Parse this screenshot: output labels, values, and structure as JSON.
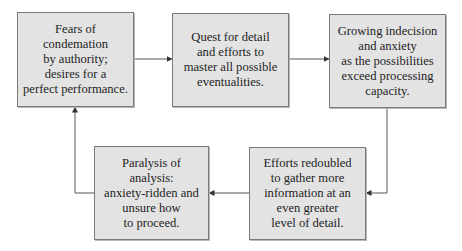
{
  "diagram": {
    "type": "cyclic-flowchart",
    "colors": {
      "box_fill": "#e3e3e3",
      "box_border": "#7a7a7a",
      "connector": "#555555",
      "text": "#1e1e1e"
    },
    "nodes": [
      {
        "id": "fears",
        "label": "Fears of\ncondemation\nby authority;\ndesires for a\nperfect performance."
      },
      {
        "id": "quest",
        "label": "Quest for detail\nand efforts to\nmaster all possible\neventualities."
      },
      {
        "id": "indecision",
        "label": "Growing indecision\nand anxiety\nas the possibilities\nexceed processing\ncapacity."
      },
      {
        "id": "efforts",
        "label": "Efforts redoubled\nto gather more\ninformation at an\neven greater\nlevel of detail."
      },
      {
        "id": "paralysis",
        "label": "Paralysis of\nanalysis:\nanxiety-ridden and\nunsure how\nto proceed."
      }
    ],
    "edges": [
      {
        "from": "fears",
        "to": "quest"
      },
      {
        "from": "quest",
        "to": "indecision"
      },
      {
        "from": "indecision",
        "to": "efforts"
      },
      {
        "from": "efforts",
        "to": "paralysis"
      },
      {
        "from": "paralysis",
        "to": "fears"
      }
    ]
  }
}
